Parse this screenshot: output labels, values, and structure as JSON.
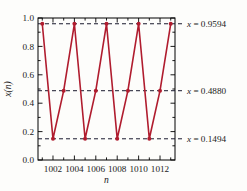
{
  "chart_data": {
    "type": "line",
    "title": "",
    "subtitle": "",
    "xlabel": "n",
    "ylabel": "x(n)",
    "xlim": [
      1000.6,
      1013.4
    ],
    "ylim": [
      0.0,
      1.0
    ],
    "grid": false,
    "legend": null,
    "x_ticks": [
      1002,
      1004,
      1006,
      1008,
      1010,
      1012
    ],
    "x_tick_labels": [
      "1002",
      "1004",
      "1006",
      "1008",
      "1010",
      "1012"
    ],
    "x_minor_ticks": [
      1001,
      1003,
      1005,
      1007,
      1009,
      1011,
      1013
    ],
    "y_ticks": [
      0.0,
      0.2,
      0.4,
      0.6,
      0.8,
      1.0
    ],
    "y_tick_labels": [
      "0.0",
      "0.2",
      "0.4",
      "0.6",
      "0.8",
      "1.0"
    ],
    "y_minor_ticks": [
      0.1,
      0.3,
      0.5,
      0.7,
      0.9
    ],
    "series": [
      {
        "name": "x(n)",
        "color": "#b01c2e",
        "marker": "circle",
        "x": [
          1001,
          1002,
          1003,
          1004,
          1005,
          1006,
          1007,
          1008,
          1009,
          1010,
          1011,
          1012,
          1013
        ],
        "values": [
          0.9594,
          0.1494,
          0.488,
          0.9594,
          0.1494,
          0.488,
          0.9594,
          0.1494,
          0.488,
          0.9594,
          0.1494,
          0.488,
          0.9594
        ]
      }
    ],
    "reference_lines": [
      {
        "y": 0.9594,
        "label_value": "0.9594",
        "label_prefix": "x =",
        "label": "x = 0.9594",
        "style": "dashed",
        "color": "#1a1a2e"
      },
      {
        "y": 0.488,
        "label_value": "0.4880",
        "label_prefix": "x =",
        "label": "x = 0.4880",
        "style": "dashed",
        "color": "#1a1a2e"
      },
      {
        "y": 0.1494,
        "label_value": "0.1494",
        "label_prefix": "x =",
        "label": "x = 0.1494",
        "style": "dashed",
        "color": "#1a1a2e"
      }
    ],
    "annotations": [
      "x = 0.9594",
      "x = 0.4880",
      "x = 0.1494"
    ]
  },
  "colors": {
    "series": "#b01c2e",
    "axis": "#000000",
    "guide": "#1a1a2e",
    "background": "#fdfdfb"
  }
}
